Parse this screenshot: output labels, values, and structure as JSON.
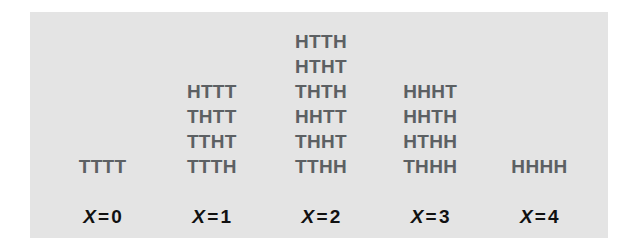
{
  "figure": {
    "panel_background": "#e4e4e4",
    "outcome_text_color": "#5c6063",
    "label_text_color": "#111111",
    "variable_symbol": "X",
    "equals_symbol": "=",
    "columns": [
      {
        "label_value": "0",
        "outcomes": [
          "TTTT"
        ]
      },
      {
        "label_value": "1",
        "outcomes": [
          "HTTT",
          "THTT",
          "TTHT",
          "TTTH"
        ]
      },
      {
        "label_value": "2",
        "outcomes": [
          "HTTH",
          "HTHT",
          "THTH",
          "HHTT",
          "THHT",
          "TTHH"
        ]
      },
      {
        "label_value": "3",
        "outcomes": [
          "HHHT",
          "HHTH",
          "HTHH",
          "THHH"
        ]
      },
      {
        "label_value": "4",
        "outcomes": [
          "HHHH"
        ]
      }
    ]
  }
}
